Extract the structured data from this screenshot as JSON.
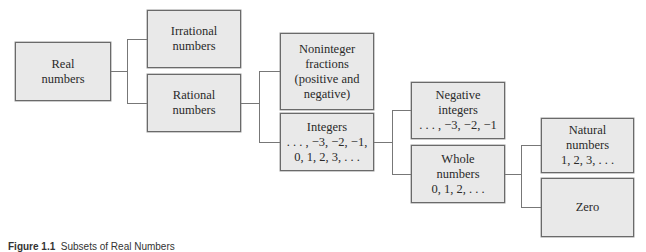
{
  "diagram": {
    "title": "Subsets of Real Numbers",
    "nodes": [
      {
        "id": "real",
        "label": "Real\nnumbers"
      },
      {
        "id": "irrational",
        "label": "Irrational\nnumbers"
      },
      {
        "id": "rational",
        "label": "Rational\nnumbers"
      },
      {
        "id": "noninteger",
        "label": "Noninteger\nfractions\n(positive and\nnegative)"
      },
      {
        "id": "integers",
        "label": "Integers\n. . . , −3, −2, −1,\n0, 1, 2, 3, . . ."
      },
      {
        "id": "negative_integers",
        "label": "Negative\nintegers\n. . . , −3, −2, −1"
      },
      {
        "id": "whole",
        "label": "Whole\nnumbers\n0, 1, 2, . . ."
      },
      {
        "id": "natural",
        "label": "Natural\nnumbers\n1, 2, 3, . . ."
      },
      {
        "id": "zero",
        "label": "Zero"
      }
    ],
    "edges": [
      [
        "real",
        "irrational"
      ],
      [
        "real",
        "rational"
      ],
      [
        "rational",
        "noninteger"
      ],
      [
        "rational",
        "integers"
      ],
      [
        "integers",
        "negative_integers"
      ],
      [
        "integers",
        "whole"
      ],
      [
        "whole",
        "natural"
      ],
      [
        "whole",
        "zero"
      ]
    ]
  },
  "caption": {
    "figure": "Figure 1.1",
    "text": "Subsets of Real Numbers"
  }
}
